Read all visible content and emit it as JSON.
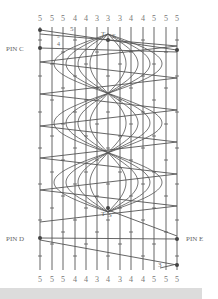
{
  "figure": {
    "top_counts": [
      "5",
      "5",
      "5",
      "4",
      "4",
      "3",
      "3",
      "3",
      "4",
      "4",
      "5",
      "5",
      "5"
    ],
    "bottom_counts": [
      "5",
      "5",
      "5",
      "4",
      "4",
      "3",
      "4",
      "3",
      "4",
      "4",
      "5",
      "5",
      "5"
    ],
    "pins": {
      "pin_c": "PIN C",
      "pin_d": "PIN D",
      "pin_e": "PIN E"
    },
    "annotations": {
      "top_5": "5",
      "top_small_5": "5",
      "top_4": "4",
      "top_T": "T",
      "top_S": "S",
      "bottom_T": "T",
      "bottom_S": "S",
      "bottom_3": "3"
    },
    "colors": {
      "ink": "#555555",
      "background": "#ffffff",
      "footer_bar": "#dcdcdc"
    }
  }
}
